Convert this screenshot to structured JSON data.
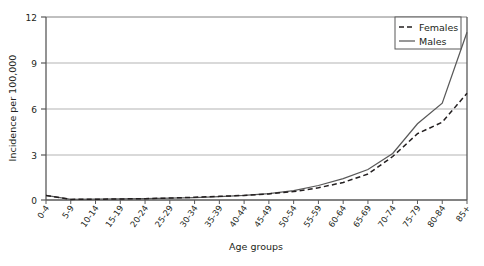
{
  "chart_data": {
    "type": "line",
    "title": "",
    "xlabel": "Age groups",
    "ylabel": "Incidence per 100,000",
    "categories": [
      "0-4",
      "5-9",
      "10-14",
      "15-19",
      "20-24",
      "25-29",
      "30-34",
      "35-39",
      "40-44",
      "45-49",
      "50-54",
      "55-59",
      "60-64",
      "65-69",
      "70-74",
      "75-79",
      "80-84",
      "85+"
    ],
    "series": [
      {
        "name": "Females",
        "style": "dashed",
        "color": "#231f20",
        "values": [
          0.3,
          0.04,
          0.05,
          0.07,
          0.09,
          0.13,
          0.18,
          0.24,
          0.3,
          0.4,
          0.55,
          0.8,
          1.15,
          1.7,
          2.85,
          4.35,
          5.1,
          7.0
        ]
      },
      {
        "name": "Males",
        "style": "solid",
        "color": "#595959",
        "values": [
          0.3,
          0.04,
          0.05,
          0.07,
          0.09,
          0.12,
          0.16,
          0.22,
          0.3,
          0.42,
          0.62,
          0.95,
          1.4,
          2.0,
          3.05,
          5.0,
          6.35,
          11.0
        ]
      }
    ],
    "ylim": [
      0,
      12
    ],
    "yticks": [
      0,
      3,
      6,
      9,
      12
    ],
    "ytick_labels": [
      "0",
      "3",
      "6",
      "9",
      "12"
    ],
    "grid": "horizontal",
    "legend_position": "top-right",
    "legend": {
      "entries": [
        {
          "label": "Females",
          "style": "dashed"
        },
        {
          "label": "Males",
          "style": "solid"
        }
      ]
    }
  }
}
